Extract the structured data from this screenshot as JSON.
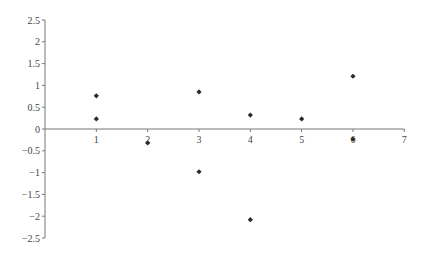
{
  "chart_data": {
    "type": "scatter",
    "title": "",
    "xlabel": "",
    "ylabel": "",
    "xlim": [
      0,
      7
    ],
    "ylim": [
      -2.5,
      2.5
    ],
    "grid": false,
    "legend": null,
    "x_ticks": [
      "1",
      "2",
      "3",
      "4",
      "5",
      "6",
      "7"
    ],
    "y_ticks": [
      "2.5",
      "2",
      "1.5",
      "1",
      "0.5",
      "0",
      "-0.5",
      "-1",
      "-1.5",
      "-2",
      "-2.5"
    ],
    "marker": "diamond",
    "marker_color": "#2a2a2a",
    "series": [
      {
        "name": "residuals",
        "points": [
          {
            "x": 1,
            "y": 0.76
          },
          {
            "x": 1,
            "y": 0.23
          },
          {
            "x": 2,
            "y": -0.32
          },
          {
            "x": 3,
            "y": 0.85
          },
          {
            "x": 3,
            "y": -0.98
          },
          {
            "x": 4,
            "y": 0.32
          },
          {
            "x": 4,
            "y": -2.08
          },
          {
            "x": 5,
            "y": 0.23
          },
          {
            "x": 6,
            "y": 1.21
          },
          {
            "x": 6,
            "y": -0.23
          }
        ]
      }
    ]
  }
}
